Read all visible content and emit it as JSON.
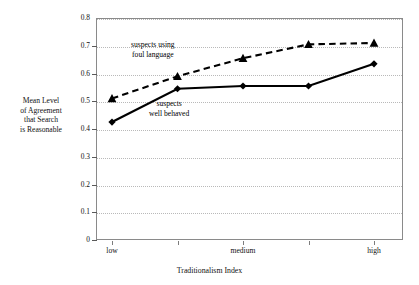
{
  "chart_data": {
    "type": "line",
    "title": "",
    "xlabel": "Traditionalism Index",
    "ylabel": "Mean Level of Agreement that Search is Reasonable",
    "ylabel_lines": [
      "Mean Level",
      "of Agreement",
      "that Search",
      "is Reasonable"
    ],
    "categories": [
      "low",
      "",
      "medium",
      "",
      "high"
    ],
    "x_tick_labels": [
      "low",
      "medium",
      "high"
    ],
    "x": [
      1,
      2,
      3,
      4,
      5
    ],
    "ylim": [
      0,
      0.8
    ],
    "y_ticks": [
      "0",
      "0.1",
      "0.2",
      "0.3",
      "0.4",
      "0.5",
      "0.6",
      "0.7",
      "0.8"
    ],
    "y_tick_values": [
      0,
      0.1,
      0.2,
      0.3,
      0.4,
      0.5,
      0.6,
      0.7,
      0.8
    ],
    "grid": true,
    "legend_position": "inline-annotations",
    "series": [
      {
        "name": "suspects using foul language",
        "label_lines": [
          "suspects using",
          "foul language"
        ],
        "marker": "triangle",
        "line_style": "dashed",
        "color": "#000000",
        "values": [
          0.51,
          0.59,
          0.655,
          0.705,
          0.71
        ]
      },
      {
        "name": "suspects well behaved",
        "label_lines": [
          "suspects",
          "well behaved"
        ],
        "marker": "diamond",
        "line_style": "solid",
        "color": "#000000",
        "values": [
          0.425,
          0.545,
          0.555,
          0.555,
          0.635
        ]
      }
    ],
    "annotations": [
      {
        "text": "suspects using foul language",
        "series": "suspects using foul language"
      },
      {
        "text": "suspects well behaved",
        "series": "suspects well behaved"
      }
    ]
  },
  "axes": {
    "y_title_line_1": "Mean Level",
    "y_title_line_2": "of Agreement",
    "y_title_line_3": "that Search",
    "y_title_line_4": "is Reasonable",
    "x_title": "Traditionalism Index"
  },
  "annotations": {
    "foul_language_line_1": "suspects using",
    "foul_language_line_2": "foul language",
    "well_behaved_line_1": "suspects",
    "well_behaved_line_2": "well behaved"
  },
  "colors": {
    "frame": "#8a8a8a",
    "gridline": "#b9b9b9",
    "series": "#000000",
    "background": "#ffffff"
  }
}
